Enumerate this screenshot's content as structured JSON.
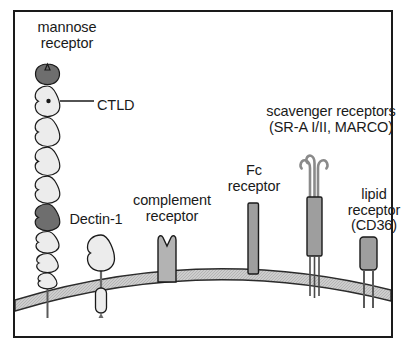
{
  "figure": {
    "background_color": "#ffffff",
    "border_color": "#1a1a1a"
  },
  "membrane": {
    "name": "plasma membrane",
    "fill_color": "#c9c9c9",
    "stroke_color": "#2b2b2b"
  },
  "palette": {
    "domain_light": "#ececec",
    "domain_dark": "#6e6e6e",
    "receptor_gray": "#b3b3b3",
    "receptor_mid": "#a0a0a0",
    "outline": "#1a1a1a"
  },
  "labels": {
    "mannose_receptor": "mannose\nreceptor",
    "ctld": "CTLD",
    "dectin1": "Dectin-1",
    "complement_receptor": "complement\nreceptor",
    "fc_receptor": "Fc\nreceptor",
    "scavenger_receptors": "scavenger receptors\n(SR-A I/II, MARCO)",
    "lipid_receptor": "lipid\nreceptor\n(CD36)"
  },
  "receptors": [
    {
      "id": "mannose-receptor",
      "label": "mannose receptor",
      "domain_count": 10,
      "dark_domain_indices": [
        0,
        5
      ],
      "annotation": "CTLD",
      "annotated_domain_index": 1
    },
    {
      "id": "dectin-1",
      "label": "Dectin-1",
      "shape": "lectin head on stalk with cytoplasmic tail"
    },
    {
      "id": "complement-receptor",
      "label": "complement receptor",
      "shape": "notched transmembrane block"
    },
    {
      "id": "fc-receptor",
      "label": "Fc receptor",
      "shape": "vertical transmembrane bar"
    },
    {
      "id": "scavenger-receptors",
      "label": "scavenger receptors (SR-A I/II, MARCO)",
      "shape": "trimeric coiled stalk with three hooked heads",
      "hook_count": 3
    },
    {
      "id": "lipid-receptor",
      "label": "lipid receptor (CD36)",
      "shape": "rounded box with two membrane-spanning legs"
    }
  ]
}
